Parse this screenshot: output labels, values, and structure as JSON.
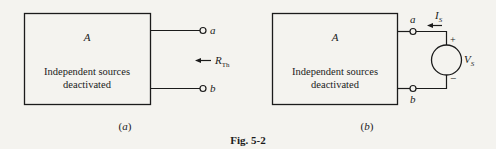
{
  "figure": {
    "caption": "Fig. 5-2",
    "panels": [
      {
        "id": "a",
        "sublabel": "(a)",
        "box_title": "A",
        "box_text_line1": "Independent sources",
        "box_text_line2": "deactivated",
        "terminal_top": "a",
        "terminal_bottom": "b",
        "arrow_label_main": "R",
        "arrow_label_sub": "Th"
      },
      {
        "id": "b",
        "sublabel": "(b)",
        "box_title": "A",
        "box_text_line1": "Independent sources",
        "box_text_line2": "deactivated",
        "terminal_top": "a",
        "terminal_bottom": "b",
        "current_label_main": "I",
        "current_label_sub": "S",
        "source_label_main": "V",
        "source_label_sub": "S",
        "source_plus": "+",
        "source_minus": "−"
      }
    ]
  },
  "colors": {
    "ink": "#1b1b1b",
    "paper": "#f4f3ef"
  }
}
